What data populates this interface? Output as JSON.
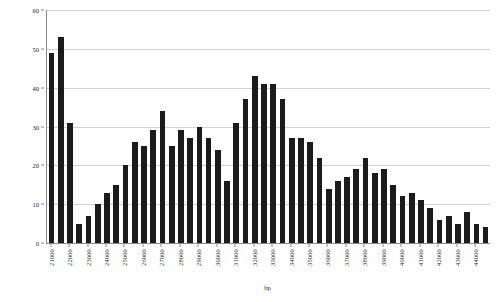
{
  "chart_data": {
    "type": "bar",
    "title": "",
    "subtitle": "",
    "xlabel": "bp",
    "ylabel": "number of uncalibrated C14 dates",
    "ylim": [
      0,
      60
    ],
    "ytick_values": [
      0,
      10,
      20,
      30,
      40,
      50,
      60
    ],
    "ytick_labels": [
      "0",
      "10",
      "20",
      "30",
      "40",
      "50",
      "60"
    ],
    "grid": true,
    "legend": null,
    "bar_color": "#1b1b1b",
    "gridline_color": "#d2d2d2",
    "axis_color": "#8a8a8a",
    "background_color": "#fefefe",
    "xtick_labels": [
      "21000",
      "22000",
      "23000",
      "24000",
      "25000",
      "26000",
      "27000",
      "28000",
      "29000",
      "30000",
      "31000",
      "32000",
      "33000",
      "34000",
      "35000",
      "36000",
      "37000",
      "38000",
      "39000",
      "40000",
      "41000",
      "42000",
      "43000",
      "44000"
    ],
    "xtick_x": [
      21000,
      22000,
      23000,
      24000,
      25000,
      26000,
      27000,
      28000,
      29000,
      30000,
      31000,
      32000,
      33000,
      34000,
      35000,
      36000,
      37000,
      38000,
      39000,
      40000,
      41000,
      42000,
      43000,
      44000
    ],
    "x_start": 21000,
    "bin_width": 500,
    "x": [
      21000,
      21500,
      22000,
      22500,
      23000,
      23500,
      24000,
      24500,
      25000,
      25500,
      26000,
      26500,
      27000,
      27500,
      28000,
      28500,
      29000,
      29500,
      30000,
      30500,
      31000,
      31500,
      32000,
      32500,
      33000,
      33500,
      34000,
      34500,
      35000,
      35500,
      36000,
      36500,
      37000,
      37500,
      38000,
      38500,
      39000,
      39500,
      40000,
      40500,
      41000,
      41500,
      42000,
      42500,
      43000,
      43500,
      44000,
      44500
    ],
    "categories": [
      "21000",
      "21500",
      "22000",
      "22500",
      "23000",
      "23500",
      "24000",
      "24500",
      "25000",
      "25500",
      "26000",
      "26500",
      "27000",
      "27500",
      "28000",
      "28500",
      "29000",
      "29500",
      "30000",
      "30500",
      "31000",
      "31500",
      "32000",
      "32500",
      "33000",
      "33500",
      "34000",
      "34500",
      "35000",
      "35500",
      "36000",
      "36500",
      "37000",
      "37500",
      "38000",
      "38500",
      "39000",
      "39500",
      "40000",
      "40500",
      "41000",
      "41500",
      "42000",
      "42500",
      "43000",
      "43500",
      "44000",
      "44500"
    ],
    "values": [
      49,
      53,
      31,
      5,
      7,
      10,
      13,
      15,
      20,
      26,
      25,
      29,
      34,
      25,
      29,
      27,
      30,
      27,
      24,
      16,
      31,
      37,
      43,
      41,
      41,
      37,
      27,
      27,
      26,
      22,
      14,
      16,
      17,
      19,
      22,
      18,
      19,
      15,
      12,
      13,
      11,
      9,
      6,
      7,
      5,
      8,
      5,
      4
    ]
  }
}
